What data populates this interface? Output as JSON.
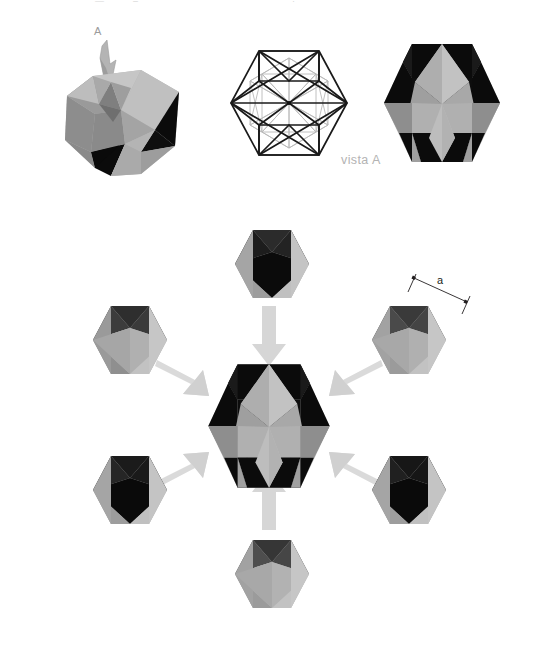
{
  "figure": {
    "background_color": "#ffffff"
  },
  "palette": {
    "black_face": "#0b0b0b",
    "dark_face": "#1c1c1c",
    "light_gray_face": "#b6b6b6",
    "mid_gray_face": "#8f8f8f",
    "pale_gray_face": "#c9c9c9",
    "deep_gray_face": "#6f6f6f",
    "arrow_gray": "#d9d9d9",
    "arrow_gray_dark": "#cfcfcf",
    "wire_visible": "#1a1a1a",
    "wire_hidden": "#b9b9b9",
    "label_gray": "#9b9b9b",
    "vista_gray": "#b3b3b3",
    "dimension_line": "#231f20"
  },
  "top_row": {
    "pictorial": {
      "name": "pictorial-view",
      "arrow_label": "A",
      "arrow_description": "leader arrow pointing to top face, labelled A"
    },
    "wireframe": {
      "name": "wireframe-view",
      "description": "hexagonal outline with internal visible and hidden edges",
      "visible_edge_color": "#1a1a1a",
      "hidden_edge_color": "#b9b9b9"
    },
    "view_a": {
      "name": "rendered-view-a",
      "caption": "vista A",
      "description": "shaded hexagonal silhouette seen along direction A"
    }
  },
  "assembly": {
    "center": {
      "name": "assembled-solid",
      "description": "completed star polyhedron, hexagonal silhouette"
    },
    "dimension": {
      "label": "a",
      "description": "edge length dimension on top-right piece"
    },
    "pieces": [
      {
        "id": "piece-top",
        "position": "top",
        "arrow": "down"
      },
      {
        "id": "piece-top-right",
        "position": "top-right",
        "arrow": "down-left"
      },
      {
        "id": "piece-bottom-right",
        "position": "bottom-right",
        "arrow": "up-left"
      },
      {
        "id": "piece-bottom",
        "position": "bottom",
        "arrow": "up"
      },
      {
        "id": "piece-bottom-left",
        "position": "bottom-left",
        "arrow": "up-right"
      },
      {
        "id": "piece-top-left",
        "position": "top-left",
        "arrow": "down-right"
      }
    ],
    "piece_count": 6
  },
  "top_crumbs": [
    {
      "text": "—",
      "x": 95
    },
    {
      "text": "–",
      "x": 133
    },
    {
      "text": "·",
      "x": 292
    }
  ]
}
